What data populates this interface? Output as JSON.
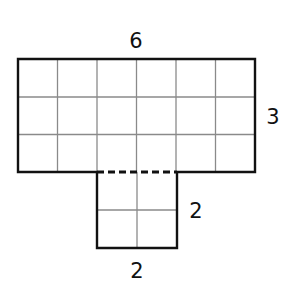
{
  "diagram": {
    "colors": {
      "outline": "#111111",
      "grid": "#8a8a8a",
      "background": "#ffffff"
    },
    "top_rect": {
      "cols": 6,
      "rows": 3
    },
    "bottom_rect": {
      "cols": 2,
      "rows": 2
    },
    "labels": {
      "top_width": "6",
      "top_height": "3",
      "bottom_height": "2",
      "bottom_width": "2"
    }
  }
}
